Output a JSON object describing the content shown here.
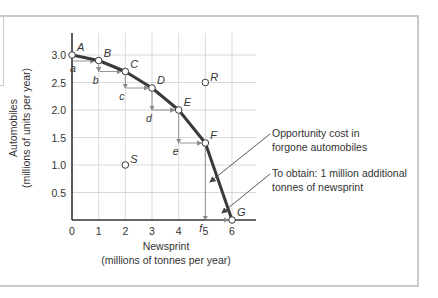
{
  "chart_data": {
    "type": "line",
    "title": "",
    "xlabel": "Newsprint",
    "xlabel_sub": "(millions of tonnes per year)",
    "ylabel": "Automobiles",
    "ylabel_sub": "(millions of units per year)",
    "xlim": [
      0,
      6
    ],
    "ylim": [
      0,
      3.0
    ],
    "x_ticks": [
      "0",
      "1",
      "2",
      "3",
      "4",
      "5",
      "6"
    ],
    "y_ticks": [
      "0.5",
      "1.0",
      "1.5",
      "2.0",
      "2.5",
      "3.0"
    ],
    "grid": true,
    "series": [
      {
        "name": "Production possibility boundary",
        "points": [
          {
            "label": "A",
            "x": 0,
            "y": 3.0
          },
          {
            "label": "B",
            "x": 1,
            "y": 2.9
          },
          {
            "label": "C",
            "x": 2,
            "y": 2.7
          },
          {
            "label": "D",
            "x": 3,
            "y": 2.4
          },
          {
            "label": "E",
            "x": 4,
            "y": 2.0
          },
          {
            "label": "F",
            "x": 5,
            "y": 1.4
          },
          {
            "label": "G",
            "x": 6,
            "y": 0.0
          }
        ]
      }
    ],
    "other_points": [
      {
        "label": "R",
        "x": 5,
        "y": 2.5
      },
      {
        "label": "S",
        "x": 2,
        "y": 1.0
      }
    ],
    "step_labels": [
      "a",
      "b",
      "c",
      "d",
      "e",
      "f"
    ],
    "annotations": [
      {
        "text_line1": "Opportunity cost in",
        "text_line2": "forgone automobiles"
      },
      {
        "text_line1": "To obtain: 1 million additional",
        "text_line2": "tonnes of newsprint"
      }
    ],
    "colors": {
      "curve": "#3a3a3a",
      "grid": "#cfcfcf",
      "arrows": "#8a8a8a",
      "axis": "#333333",
      "text": "#333333"
    }
  }
}
